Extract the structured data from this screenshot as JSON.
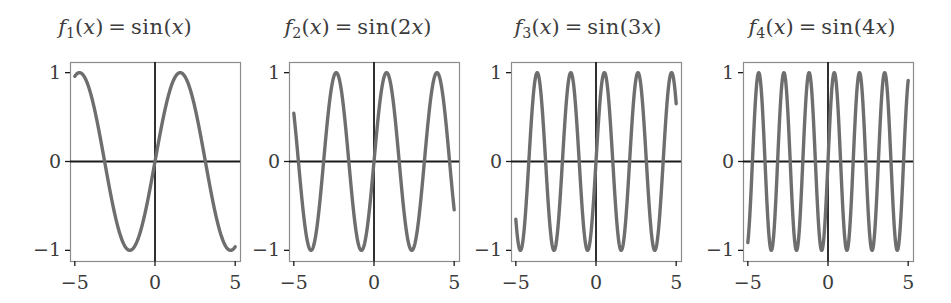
{
  "figure": {
    "width": 951,
    "height": 303,
    "background": "#ffffff",
    "curve_color": "#6e6e6e",
    "axis_color": "#1a1a1a",
    "box_color": "#8c8c8c",
    "text_color": "#3c3c3c"
  },
  "chart_data": [
    {
      "type": "line",
      "title": "f_1(x) = sin(x)",
      "title_parts": {
        "f": "f",
        "sub": "1",
        "arg_open": "(",
        "var": "x",
        "arg_close": ")",
        "equals": "=",
        "func": "sin",
        "body_open": "(",
        "coef": "",
        "body_var": "x",
        "body_close": ")"
      },
      "expression": "sin(x)",
      "frequency": 1,
      "amplitude": 1,
      "xlabel": "",
      "ylabel": "",
      "xlim": [
        -5.3,
        5.3
      ],
      "ylim": [
        -1.12,
        1.12
      ],
      "xticks": [
        -5,
        0,
        5
      ],
      "xticklabels": [
        "−5",
        "0",
        "5"
      ],
      "yticks": [
        -1,
        0,
        1
      ],
      "yticklabels": [
        "−1",
        "0",
        "1"
      ],
      "grid": false,
      "legend": false,
      "zero_axis_horizontal": 0,
      "zero_axis_vertical": 0
    },
    {
      "type": "line",
      "title": "f_2(x) = sin(2x)",
      "title_parts": {
        "f": "f",
        "sub": "2",
        "arg_open": "(",
        "var": "x",
        "arg_close": ")",
        "equals": "=",
        "func": "sin",
        "body_open": "(",
        "coef": "2",
        "body_var": "x",
        "body_close": ")"
      },
      "expression": "sin(2x)",
      "frequency": 2,
      "amplitude": 1,
      "xlabel": "",
      "ylabel": "",
      "xlim": [
        -5.3,
        5.3
      ],
      "ylim": [
        -1.12,
        1.12
      ],
      "xticks": [
        -5,
        0,
        5
      ],
      "xticklabels": [
        "−5",
        "0",
        "5"
      ],
      "yticks": [
        -1,
        0,
        1
      ],
      "yticklabels": [
        "−1",
        "0",
        "1"
      ],
      "grid": false,
      "legend": false,
      "zero_axis_horizontal": 0,
      "zero_axis_vertical": 0
    },
    {
      "type": "line",
      "title": "f_3(x) = sin(3x)",
      "title_parts": {
        "f": "f",
        "sub": "3",
        "arg_open": "(",
        "var": "x",
        "arg_close": ")",
        "equals": "=",
        "func": "sin",
        "body_open": "(",
        "coef": "3",
        "body_var": "x",
        "body_close": ")"
      },
      "expression": "sin(3x)",
      "frequency": 3,
      "amplitude": 1,
      "xlabel": "",
      "ylabel": "",
      "xlim": [
        -5.3,
        5.3
      ],
      "ylim": [
        -1.12,
        1.12
      ],
      "xticks": [
        -5,
        0,
        5
      ],
      "xticklabels": [
        "−5",
        "0",
        "5"
      ],
      "yticks": [
        -1,
        0,
        1
      ],
      "yticklabels": [
        "−1",
        "0",
        "1"
      ],
      "grid": false,
      "legend": false,
      "zero_axis_horizontal": 0,
      "zero_axis_vertical": 0
    },
    {
      "type": "line",
      "title": "f_4(x) = sin(4x)",
      "title_parts": {
        "f": "f",
        "sub": "4",
        "arg_open": "(",
        "var": "x",
        "arg_close": ")",
        "equals": "=",
        "func": "sin",
        "body_open": "(",
        "coef": "4",
        "body_var": "x",
        "body_close": ")"
      },
      "expression": "sin(4x)",
      "frequency": 4,
      "amplitude": 1,
      "xlabel": "",
      "ylabel": "",
      "xlim": [
        -5.3,
        5.3
      ],
      "ylim": [
        -1.12,
        1.12
      ],
      "xticks": [
        -5,
        0,
        5
      ],
      "xticklabels": [
        "−5",
        "0",
        "5"
      ],
      "yticks": [
        -1,
        0,
        1
      ],
      "yticklabels": [
        "−1",
        "0",
        "1"
      ],
      "grid": false,
      "legend": false,
      "zero_axis_horizontal": 0,
      "zero_axis_vertical": 0
    }
  ],
  "panels": [
    {
      "id": "panel-1",
      "left": 0,
      "width": 250,
      "box": {
        "x": 70,
        "y": 62,
        "w": 170,
        "h": 199
      },
      "ylabels": [
        "1",
        "0",
        "−1"
      ],
      "xlabels": [
        "−5",
        "0",
        "5"
      ]
    },
    {
      "id": "panel-2",
      "left": 233,
      "width": 250,
      "box": {
        "x": 56,
        "y": 62,
        "w": 170,
        "h": 199
      },
      "ylabels": [
        "1",
        "0",
        "−1"
      ],
      "xlabels": [
        "−5",
        "0",
        "5"
      ]
    },
    {
      "id": "panel-3",
      "left": 463,
      "width": 250,
      "box": {
        "x": 48,
        "y": 62,
        "w": 170,
        "h": 199
      },
      "ylabels": [
        "1",
        "0",
        "−1"
      ],
      "xlabels": [
        "−5",
        "0",
        "5"
      ]
    },
    {
      "id": "panel-4",
      "left": 693,
      "width": 258,
      "box": {
        "x": 50,
        "y": 62,
        "w": 170,
        "h": 199
      },
      "ylabels": [
        "1",
        "0",
        "−1"
      ],
      "xlabels": [
        "−5",
        "0",
        "5"
      ]
    }
  ]
}
